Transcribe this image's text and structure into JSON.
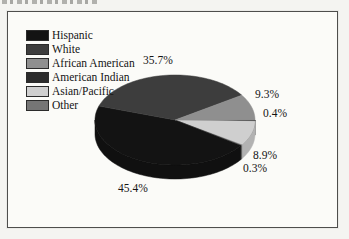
{
  "chart_data": {
    "type": "pie",
    "style": "3d",
    "title": "",
    "labels": [
      "Hispanic",
      "White",
      "African American",
      "American Indian",
      "Asian/Pacific",
      "Other"
    ],
    "values": [
      45.4,
      35.7,
      9.3,
      0.4,
      8.9,
      0.3
    ],
    "percent_labels": [
      "45.4%",
      "35.7%",
      "9.3%",
      "0.4%",
      "8.9%",
      "0.3%"
    ],
    "colors": [
      "#131313",
      "#3d3d3d",
      "#8f8f8f",
      "#2b2b2b",
      "#cfcfcf",
      "#757575"
    ],
    "legend_position": "top-left",
    "palette_note_background": "#fbfbf8",
    "frame_border_color": "#4e4e4c"
  }
}
